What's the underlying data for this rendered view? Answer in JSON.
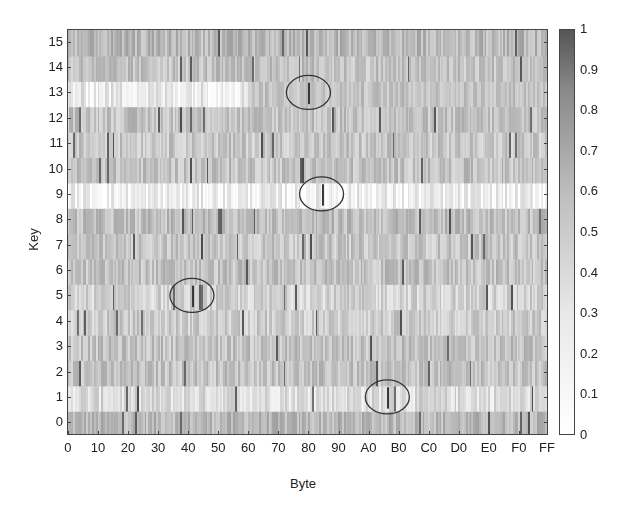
{
  "chart_data": {
    "type": "heatmap",
    "title": "",
    "xlabel": "Byte",
    "ylabel": "Key",
    "x_ticks": [
      "0",
      "10",
      "20",
      "30",
      "40",
      "50",
      "60",
      "70",
      "80",
      "90",
      "A0",
      "B0",
      "C0",
      "D0",
      "E0",
      "F0",
      "FF"
    ],
    "y_ticks": [
      "0",
      "1",
      "2",
      "3",
      "4",
      "5",
      "6",
      "7",
      "8",
      "9",
      "10",
      "11",
      "12",
      "13",
      "14",
      "15"
    ],
    "x_range": [
      0,
      255
    ],
    "y_range": [
      0,
      15
    ],
    "colorbar": {
      "range": [
        0,
        1
      ],
      "ticks": [
        "0",
        "0.1",
        "0.2",
        "0.3",
        "0.4",
        "0.5",
        "0.6",
        "0.7",
        "0.8",
        "0.9",
        "1"
      ],
      "colormap": "gray (white = 0, dark = 1)"
    },
    "row_mean_intensity": [
      {
        "key": 0,
        "mean": 0.35
      },
      {
        "key": 1,
        "mean": 0.18
      },
      {
        "key": 2,
        "mean": 0.3
      },
      {
        "key": 3,
        "mean": 0.3
      },
      {
        "key": 4,
        "mean": 0.25
      },
      {
        "key": 5,
        "mean": 0.22
      },
      {
        "key": 6,
        "mean": 0.3
      },
      {
        "key": 7,
        "mean": 0.28
      },
      {
        "key": 8,
        "mean": 0.32
      },
      {
        "key": 9,
        "mean": 0.08
      },
      {
        "key": 10,
        "mean": 0.3
      },
      {
        "key": 11,
        "mean": 0.28
      },
      {
        "key": 12,
        "mean": 0.3
      },
      {
        "key": 13,
        "mean": 0.12
      },
      {
        "key": 14,
        "mean": 0.3
      },
      {
        "key": 15,
        "mean": 0.35
      }
    ],
    "highlighted_peaks": [
      {
        "key": 13,
        "byte": "0x80",
        "value": 1.0
      },
      {
        "key": 9,
        "byte": "0x87",
        "value": 1.0
      },
      {
        "key": 5,
        "byte": "0x42",
        "value": 1.0
      },
      {
        "key": 1,
        "byte": "0xAA",
        "value": 1.0
      }
    ],
    "annotations": "Four ellipses circle the maximum-correlation byte for keys 13, 9, 5 and 1"
  }
}
